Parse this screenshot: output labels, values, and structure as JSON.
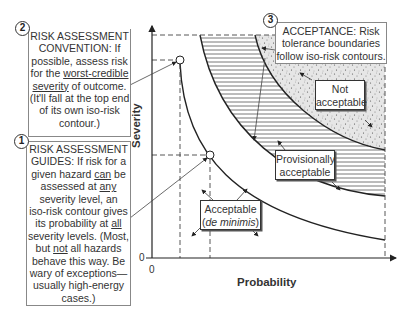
{
  "axes": {
    "x_label": "Probability",
    "y_label": "Severity",
    "x_origin": "0",
    "y_origin": "0"
  },
  "callouts": {
    "c2": {
      "number": "2",
      "title": "RISK ASSESSMENT CONVENTION:",
      "lines": [
        "RISK ASSESSMENT",
        "CONVENTION: If",
        "possible, assess risk",
        "for the ",
        "worst-credible",
        "severity",
        " of outcome.",
        "(It'll fall at the top end",
        "of its own iso-risk",
        "contour.)"
      ]
    },
    "c1": {
      "number": "1",
      "lines": [
        "RISK ASSESSMENT",
        "GUIDES: If risk for a",
        "given hazard ",
        "can",
        " be",
        "assessed at ",
        "any",
        "severity level, an",
        "iso-risk contour gives",
        "its probability at ",
        "all",
        "severity levels. (Most,",
        "but ",
        "not",
        " all hazards",
        "behave this way. Be",
        "wary of exceptions—",
        "usually high-energy",
        "cases.)"
      ]
    },
    "c3": {
      "number": "3",
      "lines": [
        "ACCEPTANCE: Risk",
        "tolerance boundaries",
        "follow iso-risk contours."
      ]
    }
  },
  "regions": {
    "not_acceptable": [
      "Not",
      "acceptable"
    ],
    "provisionally_acceptable": [
      "Provisionally",
      "acceptable"
    ],
    "acceptable": [
      "Acceptable",
      "de minimis"
    ]
  },
  "colors": {
    "line": "#222222",
    "stipple_bg": "#e4e4e4",
    "hatch": "#555555",
    "box_border": "#888888"
  }
}
